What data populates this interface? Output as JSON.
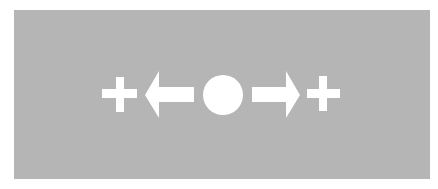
{
  "diagram": {
    "background_color": "#ffffff",
    "panel_color": "#b5b5b5",
    "symbol_color": "#ffffff",
    "sequence": [
      {
        "type": "plus",
        "name": "left-plus"
      },
      {
        "type": "arrow",
        "direction": "left",
        "name": "left-arrow"
      },
      {
        "type": "circle",
        "name": "center-circle"
      },
      {
        "type": "arrow",
        "direction": "right",
        "name": "right-arrow"
      },
      {
        "type": "plus",
        "name": "right-plus"
      }
    ]
  }
}
